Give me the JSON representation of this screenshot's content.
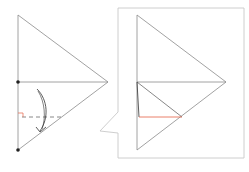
{
  "figure": {
    "colors": {
      "line": "#8a8a8a",
      "dark_line": "#4a4a4a",
      "accent_red": "#e8735a",
      "callout_border": "#c8c8c8",
      "dot": "#222222"
    },
    "left_diagram": {
      "name": "fold-step",
      "triangle": {
        "top": [
          18,
          15
        ],
        "apex": [
          108,
          82
        ],
        "bottom": [
          18,
          150
        ]
      },
      "midline_y": 82,
      "dashed_fold_y": 117,
      "points": [
        [
          18,
          82
        ],
        [
          18,
          150
        ]
      ],
      "right_angle_marker": [
        18,
        117
      ],
      "arrow": "curved-fold-arrow"
    },
    "callout": {
      "box": [
        118,
        8,
        244,
        158
      ],
      "pointer_tip": [
        100,
        131
      ]
    },
    "right_diagram": {
      "name": "fold-result",
      "triangle": {
        "top": [
          137,
          15
        ],
        "apex": [
          226,
          82
        ],
        "bottom": [
          137,
          150
        ]
      },
      "midline_y": 82,
      "folded_edge": [
        [
          137,
          82
        ],
        [
          182,
          117
        ]
      ],
      "red_edge": [
        [
          137,
          117
        ],
        [
          182,
          117
        ]
      ]
    }
  }
}
